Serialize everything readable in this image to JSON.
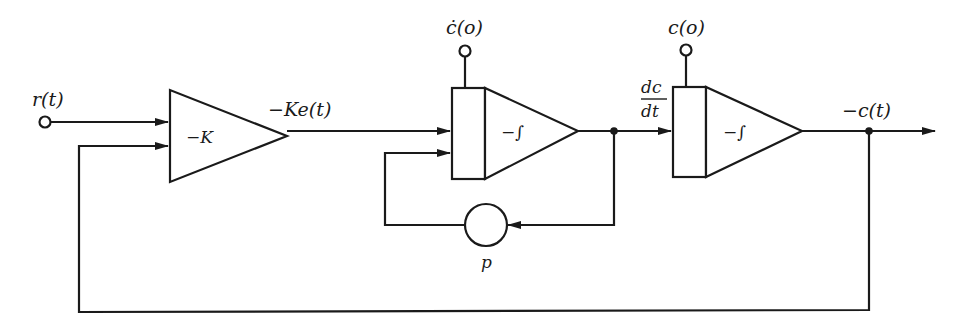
{
  "diagram": {
    "type": "analog-computer block diagram",
    "colors": {
      "ink": "#1a1a1a",
      "background": "#ffffff"
    },
    "input": {
      "label": "r(t)"
    },
    "gain_block": {
      "label": "−K",
      "output_label": "−Ke(t)"
    },
    "integrator_1": {
      "label": "−∫",
      "initial_condition_label": "ċ(o)",
      "output_label_num": "dc",
      "output_label_den": "dt"
    },
    "feedback_coefficient": {
      "label": "p"
    },
    "integrator_2": {
      "label": "−∫",
      "initial_condition_label": "c(o)",
      "output_label": "−c(t)"
    }
  }
}
